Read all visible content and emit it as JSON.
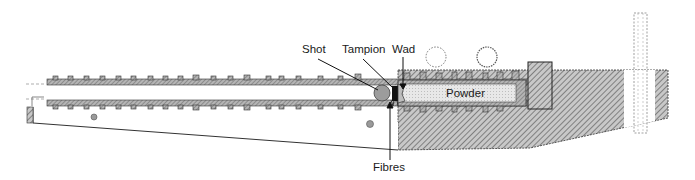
{
  "diagram": {
    "labels": {
      "shot": "Shot",
      "tampion": "Tampion",
      "wad": "Wad",
      "powder": "Powder",
      "fibres": "Fibres"
    },
    "colors": {
      "line": "#222222",
      "barrel_fill": "#9a9a9a",
      "hatch": "#8a8a8a",
      "powder_fill": "#e4e4e4",
      "shot_fill": "#9c9c9c",
      "tampion_fill": "#111111",
      "background": "#ffffff"
    }
  }
}
